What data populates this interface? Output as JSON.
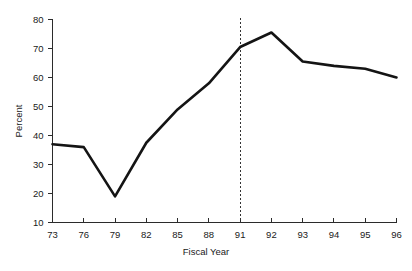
{
  "chart_data": {
    "type": "line",
    "title": "",
    "subtitle": "",
    "xlabel": "Fiscal Year",
    "ylabel": "Percent",
    "categories": [
      "73",
      "76",
      "79",
      "82",
      "85",
      "88",
      "91",
      "92",
      "93",
      "94",
      "95",
      "96"
    ],
    "x_tick_labels": [
      "73",
      "76",
      "79",
      "82",
      "85",
      "88",
      "91",
      "92",
      "93",
      "94",
      "95",
      "96"
    ],
    "y_tick_labels": [
      "10",
      "20",
      "30",
      "40",
      "50",
      "60",
      "70",
      "80"
    ],
    "y_ticks": [
      10,
      20,
      30,
      40,
      50,
      60,
      70,
      80
    ],
    "ylim": [
      10,
      80
    ],
    "xlim": [
      0,
      11
    ],
    "grid": false,
    "legend": false,
    "legend_position": "none",
    "series": [
      {
        "name": "Percent",
        "values": [
          37,
          36,
          19,
          37.5,
          49,
          58,
          70.5,
          75.5,
          65.5,
          64,
          63,
          60
        ]
      }
    ],
    "annotations": [
      {
        "name": "reference-line",
        "type": "vertical-dashed-line",
        "x_category": "91",
        "label": ""
      }
    ],
    "line_color": "#141414",
    "axis_color": "#2b2b2b",
    "marker_line_color": "#333333",
    "background_color": "#ffffff"
  }
}
